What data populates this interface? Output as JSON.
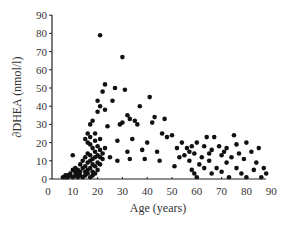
{
  "chart_data": {
    "type": "scatter",
    "title": "",
    "xlabel": "Age (years)",
    "ylabel": "∂DHEA (nmol/l)",
    "xlim": [
      0,
      90
    ],
    "ylim": [
      0,
      90
    ],
    "xticks": [
      0,
      10,
      20,
      30,
      40,
      50,
      60,
      70,
      80,
      90
    ],
    "yticks": [
      0,
      10,
      20,
      30,
      40,
      50,
      60,
      70,
      80,
      90
    ],
    "grid": false,
    "legend": null,
    "marker_color": "#111111",
    "points": [
      [
        6,
        1
      ],
      [
        7,
        1
      ],
      [
        7,
        2
      ],
      [
        8,
        2
      ],
      [
        8,
        1
      ],
      [
        9,
        2
      ],
      [
        9,
        3
      ],
      [
        10,
        1
      ],
      [
        10,
        5
      ],
      [
        10,
        13
      ],
      [
        11,
        2
      ],
      [
        11,
        4
      ],
      [
        11,
        6
      ],
      [
        12,
        1
      ],
      [
        12,
        3
      ],
      [
        12,
        5
      ],
      [
        13,
        2
      ],
      [
        13,
        4
      ],
      [
        13,
        8
      ],
      [
        14,
        1
      ],
      [
        14,
        6
      ],
      [
        14,
        10
      ],
      [
        15,
        2
      ],
      [
        15,
        4
      ],
      [
        15,
        7
      ],
      [
        15,
        12
      ],
      [
        15,
        22
      ],
      [
        16,
        3
      ],
      [
        16,
        5
      ],
      [
        16,
        9
      ],
      [
        16,
        14
      ],
      [
        16,
        20
      ],
      [
        16,
        25
      ],
      [
        17,
        1
      ],
      [
        17,
        6
      ],
      [
        17,
        10
      ],
      [
        17,
        13
      ],
      [
        17,
        19
      ],
      [
        17,
        23
      ],
      [
        17,
        30
      ],
      [
        18,
        2
      ],
      [
        18,
        4
      ],
      [
        18,
        8
      ],
      [
        18,
        11
      ],
      [
        18,
        17
      ],
      [
        18,
        32
      ],
      [
        19,
        3
      ],
      [
        19,
        7
      ],
      [
        19,
        12
      ],
      [
        19,
        15
      ],
      [
        19,
        21
      ],
      [
        19,
        25
      ],
      [
        20,
        5
      ],
      [
        20,
        9
      ],
      [
        20,
        13
      ],
      [
        20,
        18
      ],
      [
        20,
        37
      ],
      [
        20,
        43
      ],
      [
        21,
        8
      ],
      [
        21,
        12
      ],
      [
        21,
        16
      ],
      [
        21,
        22
      ],
      [
        21,
        40
      ],
      [
        21,
        79
      ],
      [
        22,
        11
      ],
      [
        22,
        14
      ],
      [
        22,
        48
      ],
      [
        23,
        17
      ],
      [
        23,
        38
      ],
      [
        23,
        52
      ],
      [
        24,
        29
      ],
      [
        25,
        12
      ],
      [
        26,
        43
      ],
      [
        27,
        50
      ],
      [
        28,
        10
      ],
      [
        28,
        21
      ],
      [
        29,
        30
      ],
      [
        30,
        31
      ],
      [
        30,
        67
      ],
      [
        31,
        49
      ],
      [
        32,
        35
      ],
      [
        32,
        15
      ],
      [
        33,
        11
      ],
      [
        33,
        33
      ],
      [
        34,
        22
      ],
      [
        35,
        32
      ],
      [
        36,
        30
      ],
      [
        37,
        40
      ],
      [
        38,
        16
      ],
      [
        39,
        11
      ],
      [
        40,
        20
      ],
      [
        41,
        45
      ],
      [
        42,
        31
      ],
      [
        43,
        34
      ],
      [
        44,
        15
      ],
      [
        45,
        10
      ],
      [
        46,
        25
      ],
      [
        47,
        33
      ],
      [
        48,
        23
      ],
      [
        50,
        24
      ],
      [
        51,
        7
      ],
      [
        52,
        17
      ],
      [
        53,
        12
      ],
      [
        54,
        20
      ],
      [
        55,
        13
      ],
      [
        56,
        17
      ],
      [
        57,
        10
      ],
      [
        57,
        15
      ],
      [
        58,
        5
      ],
      [
        58,
        18
      ],
      [
        59,
        3
      ],
      [
        59,
        14
      ],
      [
        60,
        1
      ],
      [
        60,
        20
      ],
      [
        61,
        8
      ],
      [
        62,
        12
      ],
      [
        63,
        6
      ],
      [
        63,
        18
      ],
      [
        64,
        23
      ],
      [
        65,
        14
      ],
      [
        65,
        10
      ],
      [
        66,
        3
      ],
      [
        66,
        16
      ],
      [
        67,
        23
      ],
      [
        68,
        6
      ],
      [
        69,
        18
      ],
      [
        70,
        4
      ],
      [
        70,
        13
      ],
      [
        71,
        15
      ],
      [
        72,
        9
      ],
      [
        72,
        17
      ],
      [
        73,
        1
      ],
      [
        74,
        12
      ],
      [
        75,
        24
      ],
      [
        76,
        6
      ],
      [
        76,
        19
      ],
      [
        77,
        14
      ],
      [
        78,
        3
      ],
      [
        79,
        11
      ],
      [
        80,
        20
      ],
      [
        80,
        1
      ],
      [
        82,
        15
      ],
      [
        83,
        5
      ],
      [
        84,
        9
      ],
      [
        85,
        17
      ],
      [
        86,
        1
      ],
      [
        87,
        6
      ],
      [
        88,
        3
      ]
    ]
  }
}
